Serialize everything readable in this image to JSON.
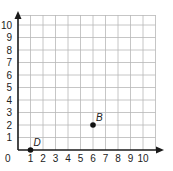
{
  "chart_data": {
    "type": "scatter",
    "title": "",
    "xlabel": "",
    "ylabel": "",
    "xlim": [
      0,
      10
    ],
    "ylim": [
      0,
      10
    ],
    "grid": true,
    "x_ticks": [
      "1",
      "2",
      "3",
      "4",
      "5",
      "6",
      "7",
      "8",
      "9",
      "10"
    ],
    "y_ticks": [
      "1",
      "2",
      "3",
      "4",
      "5",
      "6",
      "7",
      "8",
      "9",
      "10"
    ],
    "origin_label": "0",
    "points": [
      {
        "label": "D",
        "x": 1,
        "y": 0
      },
      {
        "label": "B",
        "x": 6,
        "y": 2
      }
    ]
  },
  "colors": {
    "grid": "#b8b8b8",
    "axis": "#1a1a1a",
    "point": "#111111",
    "text": "#222222"
  }
}
